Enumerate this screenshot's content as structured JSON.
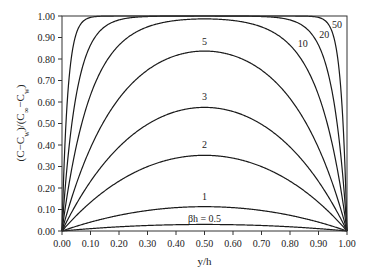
{
  "chart_data": {
    "type": "line",
    "title": "",
    "xlabel": "y/h",
    "ylabel": "(C-Cw)/(C∞-Cw)",
    "xlim": [
      0,
      1
    ],
    "ylim": [
      0,
      1
    ],
    "grid": false,
    "legend": "inline curve labels",
    "x_ticks": [
      "0.00",
      "0.10",
      "0.20",
      "0.30",
      "0.40",
      "0.50",
      "0.60",
      "0.70",
      "0.80",
      "0.90",
      "1.00"
    ],
    "y_ticks": [
      "0.00",
      "0.10",
      "0.20",
      "0.30",
      "0.40",
      "0.50",
      "0.60",
      "0.70",
      "0.80",
      "0.90",
      "1.00"
    ],
    "formula": "1 - cosh(βh(y/h - 0.5)) / cosh(βh/2)",
    "series": [
      {
        "name": "βh = 0.5",
        "beta_h": 0.5,
        "label": "βh = 0.5",
        "peak_value": 0.03,
        "label_pos": [
          0.5,
          -0.06
        ]
      },
      {
        "name": "1",
        "beta_h": 1,
        "label": "1",
        "peak_value": 0.11,
        "label_pos": [
          0.5,
          0.145
        ]
      },
      {
        "name": "2",
        "beta_h": 2,
        "label": "2",
        "peak_value": 0.35,
        "label_pos": [
          0.5,
          0.385
        ]
      },
      {
        "name": "3",
        "beta_h": 3,
        "label": "3",
        "peak_value": 0.58,
        "label_pos": [
          0.5,
          0.61
        ]
      },
      {
        "name": "5",
        "beta_h": 5,
        "label": "5",
        "peak_value": 0.84,
        "label_pos": [
          0.5,
          0.865
        ]
      },
      {
        "name": "10",
        "beta_h": 10,
        "label": "10",
        "peak_value": 0.99,
        "label_pos": [
          0.845,
          0.855
        ]
      },
      {
        "name": "20",
        "beta_h": 20,
        "label": "20",
        "peak_value": 1.0,
        "label_pos": [
          0.92,
          0.9
        ]
      },
      {
        "name": "50",
        "beta_h": 50,
        "label": "50",
        "peak_value": 1.0,
        "label_pos": [
          0.965,
          0.945
        ]
      }
    ],
    "x": [
      0.0,
      0.1,
      0.2,
      0.3,
      0.4,
      0.5,
      0.6,
      0.7,
      0.8,
      0.9,
      1.0
    ],
    "values_by_series": {
      "0.5": [
        0.0,
        0.011,
        0.02,
        0.026,
        0.029,
        0.031,
        0.029,
        0.026,
        0.02,
        0.011,
        0.0
      ],
      "1": [
        0.0,
        0.04,
        0.071,
        0.094,
        0.108,
        0.113,
        0.108,
        0.094,
        0.071,
        0.04,
        0.0
      ],
      "2": [
        0.0,
        0.129,
        0.23,
        0.302,
        0.338,
        0.352,
        0.338,
        0.302,
        0.23,
        0.129,
        0.0
      ],
      "3": [
        0.0,
        0.23,
        0.398,
        0.5,
        0.557,
        0.575,
        0.557,
        0.5,
        0.398,
        0.23,
        0.0
      ],
      "5": [
        0.0,
        0.389,
        0.62,
        0.741,
        0.811,
        0.837,
        0.811,
        0.741,
        0.62,
        0.389,
        0.0
      ],
      "10": [
        0.0,
        0.632,
        0.865,
        0.95,
        0.982,
        0.987,
        0.982,
        0.95,
        0.865,
        0.632,
        0.0
      ],
      "20": [
        0.0,
        0.865,
        0.982,
        0.998,
        1.0,
        1.0,
        1.0,
        0.998,
        0.982,
        0.865,
        0.0
      ],
      "50": [
        0.0,
        0.993,
        1.0,
        1.0,
        1.0,
        1.0,
        1.0,
        1.0,
        1.0,
        0.993,
        0.0
      ]
    }
  }
}
